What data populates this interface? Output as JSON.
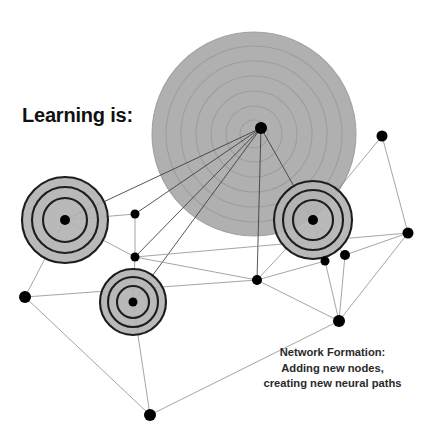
{
  "headline": "Learning is:",
  "caption": {
    "line1": "Network Formation:",
    "line2": "Adding new nodes,",
    "line3": "creating new neural paths"
  },
  "colors": {
    "background": "#ffffff",
    "node_fill": "#000000",
    "edge": "#8a8a8a",
    "edge_dark": "#3a3a3a",
    "cluster_fill": "#b3b3b3",
    "cluster_ring": "#1d1d1d",
    "big_circle_fill": "#b0b0b0",
    "big_circle_ring": "#9a9a9a",
    "text": "#111111"
  },
  "diagram": {
    "type": "node-link-network",
    "width": 429,
    "height": 444,
    "big_circle": {
      "cx": 254,
      "cy": 134,
      "r": 102,
      "rings": [
        102,
        88,
        73,
        58,
        43,
        28,
        14
      ]
    },
    "clusters": [
      {
        "id": "cluster-left",
        "cx": 65,
        "cy": 220,
        "rings": [
          43,
          33,
          22
        ],
        "hub": true
      },
      {
        "id": "cluster-right",
        "cx": 313,
        "cy": 220,
        "rings": [
          39,
          30,
          20
        ],
        "hub": true
      },
      {
        "id": "cluster-bottom",
        "cx": 133,
        "cy": 302,
        "rings": [
          33,
          25,
          16
        ],
        "hub": true
      }
    ],
    "nodes": [
      {
        "id": "n-big",
        "x": 261,
        "y": 128,
        "r": 6.0
      },
      {
        "id": "n-left",
        "x": 65,
        "y": 220,
        "r": 5.0
      },
      {
        "id": "n-right",
        "x": 313,
        "y": 220,
        "r": 5.0
      },
      {
        "id": "n-bottom",
        "x": 133,
        "y": 302,
        "r": 4.5
      },
      {
        "id": "n-mid-up",
        "x": 135,
        "y": 214,
        "r": 4.5
      },
      {
        "id": "n-mid-low",
        "x": 135,
        "y": 257,
        "r": 4.5
      },
      {
        "id": "n-center",
        "x": 257,
        "y": 280,
        "r": 5.0
      },
      {
        "id": "n-topright",
        "x": 382,
        "y": 136,
        "r": 5.5
      },
      {
        "id": "n-far-right",
        "x": 408,
        "y": 233,
        "r": 5.5
      },
      {
        "id": "n-r-sub-a",
        "x": 345,
        "y": 255,
        "r": 5.0
      },
      {
        "id": "n-r-sub-b",
        "x": 325,
        "y": 261,
        "r": 4.5
      },
      {
        "id": "n-left-out",
        "x": 25,
        "y": 297,
        "r": 6.0
      },
      {
        "id": "n-bottom-c",
        "x": 150,
        "y": 415,
        "r": 6.0
      },
      {
        "id": "n-bottom-r",
        "x": 339,
        "y": 321,
        "r": 6.0
      }
    ],
    "edges": [
      [
        "n-big",
        "n-left"
      ],
      [
        "n-big",
        "n-mid-up"
      ],
      [
        "n-big",
        "n-mid-low"
      ],
      [
        "n-big",
        "n-bottom"
      ],
      [
        "n-big",
        "n-center"
      ],
      [
        "n-big",
        "n-right"
      ],
      [
        "n-left",
        "n-mid-up"
      ],
      [
        "n-left",
        "n-mid-low"
      ],
      [
        "n-left",
        "n-left-out"
      ],
      [
        "n-mid-up",
        "n-mid-low"
      ],
      [
        "n-mid-low",
        "n-bottom"
      ],
      [
        "n-mid-low",
        "n-center"
      ],
      [
        "n-mid-low",
        "n-far-right"
      ],
      [
        "n-left-out",
        "n-center"
      ],
      [
        "n-left-out",
        "n-bottom-c"
      ],
      [
        "n-bottom",
        "n-bottom-c"
      ],
      [
        "n-center",
        "n-right"
      ],
      [
        "n-center",
        "n-r-sub-b"
      ],
      [
        "n-center",
        "n-bottom-r"
      ],
      [
        "n-right",
        "n-topright"
      ],
      [
        "n-right",
        "n-r-sub-a"
      ],
      [
        "n-right",
        "n-r-sub-b"
      ],
      [
        "n-topright",
        "n-far-right"
      ],
      [
        "n-far-right",
        "n-r-sub-a"
      ],
      [
        "n-far-right",
        "n-bottom-r"
      ],
      [
        "n-r-sub-a",
        "n-bottom-r"
      ],
      [
        "n-r-sub-b",
        "n-bottom-r"
      ],
      [
        "n-bottom-c",
        "n-bottom-r"
      ]
    ]
  }
}
